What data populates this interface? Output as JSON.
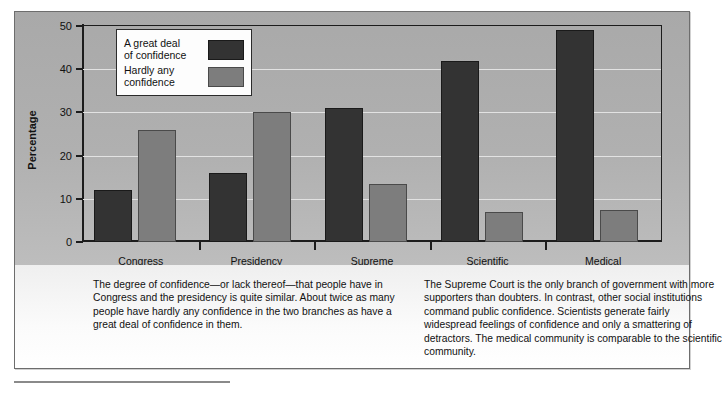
{
  "chart_data": {
    "type": "bar",
    "title": "",
    "xlabel": "Institution",
    "ylabel": "Percentage",
    "ylim": [
      0,
      50
    ],
    "yticks": [
      0,
      10,
      20,
      30,
      40,
      50
    ],
    "grid": true,
    "legend_position": "top-left-inside",
    "categories": [
      "Congress",
      "Presidency",
      "Supreme\nCourt",
      "Scientific\ncommunity",
      "Medical\ncommunity"
    ],
    "series": [
      {
        "name": "A great deal\nof confidence",
        "color": "#333333",
        "values": [
          12,
          16,
          31,
          42,
          49
        ]
      },
      {
        "name": "Hardly any\nconfidence",
        "color": "#7d7d7d",
        "values": [
          26,
          30,
          13.5,
          7,
          7.5
        ]
      }
    ]
  },
  "legend": {
    "items": [
      {
        "label": "A great deal\nof confidence",
        "swatch": "dark"
      },
      {
        "label": "Hardly any\nconfidence",
        "swatch": "light"
      }
    ]
  },
  "axes": {
    "y_title": "Percentage",
    "x_title": "Institution",
    "y_tick_labels": [
      "0",
      "10",
      "20",
      "30",
      "40",
      "50"
    ]
  },
  "captions": {
    "left": "The degree of confidence—or lack thereof—that people have in Congress and the presidency is quite similar. About twice as many people have hardly any confidence in the two branches as have a great deal of confidence in them.",
    "right": "The Supreme Court is the only branch of government with more supporters than doubters. In contrast, other social institutions command public confidence. Scientists generate fairly widespread feelings of confidence and only a smattering of detractors. The medical community is comparable to the scientific community."
  },
  "colors": {
    "series_dark": "#333333",
    "series_light": "#7d7d7d",
    "chart_background": "#b0b0b0",
    "caption_background": "#fbfbfb",
    "axis": "#1c1c1c",
    "gridline": "#e2e2e2"
  }
}
